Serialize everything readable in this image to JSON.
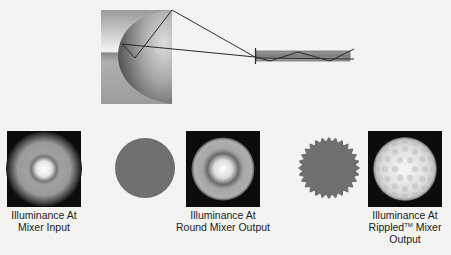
{
  "figure": {
    "top_diagram": {
      "reflector_label": "Elliptical reflector with lamp",
      "mixer_label": "Light mixer rod"
    },
    "panels": [
      {
        "id": "mixer-input",
        "kind": "illuminance-map",
        "caption_line1": "Illuminance At",
        "caption_line2": "Mixer Input",
        "caption_line3": ""
      },
      {
        "id": "round-mixer-cross-section",
        "kind": "mixer-cross-section",
        "shape": "round"
      },
      {
        "id": "round-mixer-output",
        "kind": "illuminance-map",
        "caption_line1": "Illuminance At",
        "caption_line2": "Round Mixer Output",
        "caption_line3": ""
      },
      {
        "id": "rippled-mixer-cross-section",
        "kind": "mixer-cross-section",
        "shape": "rippled"
      },
      {
        "id": "rippled-mixer-output",
        "kind": "illuminance-map",
        "caption_line1": "Illuminance At",
        "caption_line2_pre": "Rippled",
        "caption_line2_sup": "TM",
        "caption_line2_post": " Mixer",
        "caption_line3": "Output"
      }
    ],
    "colors": {
      "background": "#f3f3f1",
      "cross_section_fill": "#6f6f6f",
      "map_background": "#0c0c0c",
      "ray_color": "#2a2a2a",
      "rod_fill": "#8d8d8d"
    }
  }
}
